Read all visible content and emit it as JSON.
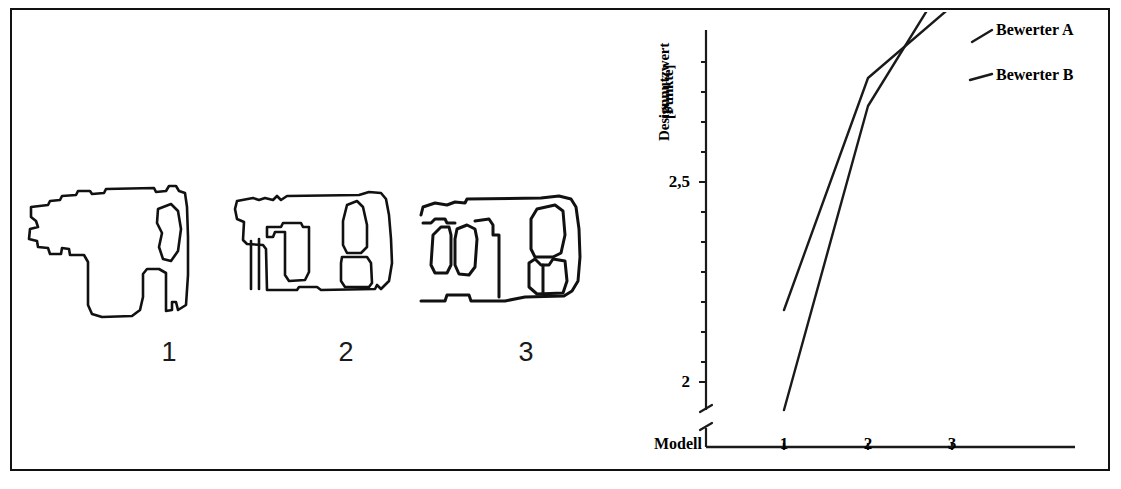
{
  "figure": {
    "has_border": true,
    "background_color": "#ffffff",
    "ink_color": "#111111"
  },
  "sketches": {
    "panel_name": "design-sketches",
    "items": [
      {
        "caption": "1",
        "name": "drill-sketch-1",
        "description": "rotary hammer drill outline sketch"
      },
      {
        "caption": "2",
        "name": "drill-sketch-2",
        "description": "rotary hammer drill outline sketch"
      },
      {
        "caption": "3",
        "name": "drill-sketch-3",
        "description": "rotary hammer drill outline sketch"
      }
    ]
  },
  "chart_data": {
    "type": "line",
    "title": "",
    "xlabel": "Modell",
    "ylabel": "Designnutzwert [Punkte]",
    "ylabel_line1": "Designnutzwert",
    "ylabel_line2": "[Punkte]",
    "categories": [
      "1",
      "2",
      "3"
    ],
    "x": [
      1,
      2,
      3
    ],
    "xtick_labels": [
      "1",
      "2",
      "3"
    ],
    "ytick_labels": [
      "2,5",
      "2"
    ],
    "ytick_values": [
      2.5,
      2.0
    ],
    "ylim": [
      1.85,
      3.1
    ],
    "xlim": [
      0.6,
      3.9
    ],
    "y_axis_broken": true,
    "grid": false,
    "legend_position": "right",
    "series": [
      {
        "name": "Bewerter A",
        "label": "Bewerter A",
        "color": "#1a1a1a",
        "values": [
          1.93,
          2.69,
          3.03
        ]
      },
      {
        "name": "Bewerter B",
        "label": "Bewerter B",
        "color": "#1a1a1a",
        "values": [
          2.18,
          2.76,
          2.94
        ]
      }
    ]
  }
}
